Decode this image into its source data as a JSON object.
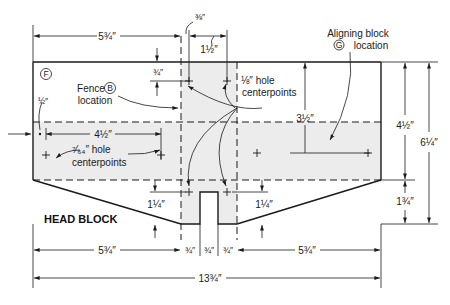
{
  "title": "HEAD BLOCK",
  "part_marker": "F",
  "colors": {
    "line": "#1a1a1a",
    "shade": "#ececec",
    "background": "#ffffff"
  },
  "labels": {
    "fence_location": {
      "line1": "Fence",
      "marker": "B",
      "line2": "location"
    },
    "aligning_block_location": {
      "line1": "Aligning block",
      "marker": "G",
      "line2": "location"
    },
    "eighth_hole": {
      "line1": "⅛″ hole",
      "line2": "centerpoints"
    },
    "seven64_hole": {
      "line1": "⁷⁄₆₄″ hole",
      "line2": "centerpoints"
    }
  },
  "dimensions": {
    "top_left_width": "5¾″",
    "top_three_eighths": "⅜″",
    "top_one_half": "1½″",
    "fence_offset": "¾″",
    "left_half": "½″",
    "hole_spacing": "4½″",
    "align_depth": "3½″",
    "right_upper": "4½″",
    "right_total": "6¼″",
    "right_lower": "1¾″",
    "notch_left": "1¼″",
    "notch_right": "1¼″",
    "bottom_left": "5¾″",
    "bottom_seg1": "¾″",
    "bottom_seg2": "¾″",
    "bottom_seg3": "¾″",
    "bottom_right": "5¾″",
    "overall_width": "13¾″"
  }
}
